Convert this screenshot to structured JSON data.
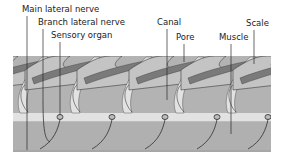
{
  "diagram": {
    "labels": [
      {
        "id": "main-lateral-nerve",
        "text": "Main lateral nerve",
        "x": 22,
        "y": 12,
        "line_x": 27,
        "line_top": 16,
        "line_bottom": 150
      },
      {
        "id": "branch-lateral-nerve",
        "text": "Branch lateral nerve",
        "x": 38,
        "y": 25,
        "line_x": 43,
        "line_top": 29,
        "line_bottom": 145
      },
      {
        "id": "sensory-organ",
        "text": "Sensory organ",
        "x": 51,
        "y": 38,
        "line_x": 60,
        "line_top": 42,
        "line_bottom": 116
      },
      {
        "id": "canal",
        "text": "Canal",
        "x": 157,
        "y": 25,
        "line_x": 167,
        "line_top": 29,
        "line_bottom": 100
      },
      {
        "id": "pore",
        "text": "Pore",
        "x": 176,
        "y": 40,
        "line_x": 184,
        "line_top": 44,
        "line_bottom": 62
      },
      {
        "id": "muscle",
        "text": "Muscle",
        "x": 223,
        "y": 40,
        "line_x": 231,
        "line_top": 44,
        "line_bottom": 134
      },
      {
        "id": "scale",
        "text": "Scale",
        "x": 246,
        "y": 26,
        "line_x": 254,
        "line_top": 30,
        "line_bottom": 64
      }
    ],
    "colors": {
      "background": "#ffffff",
      "scale_light": "#c4c4c4",
      "scale_dark": "#7a7a7a",
      "scale_outline": "#3a3a3a",
      "body_fill": "#b3b3b3",
      "canal_fill": "#e2e2e2",
      "muscle_fill": "#b0b0b0",
      "line": "#2a2a2a",
      "label_text": "#222222"
    },
    "sensory_organ_positions_x": [
      60,
      112,
      165,
      217,
      268
    ]
  }
}
